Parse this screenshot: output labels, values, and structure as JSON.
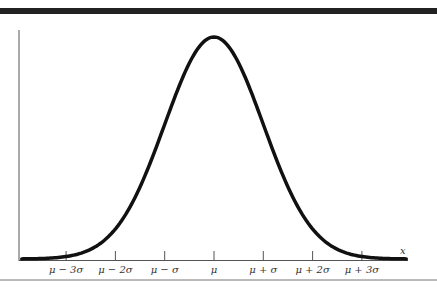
{
  "chart_data": {
    "type": "line",
    "title": "",
    "subtitle": "Normal distribution (bell curve)",
    "xlabel": "x",
    "ylabel": "",
    "tick_labels": [
      "μ − 3σ",
      "μ − 2σ",
      "μ − σ",
      "μ",
      "μ + σ",
      "μ + 2σ",
      "μ + 3σ"
    ],
    "tick_values": [
      -3,
      -2,
      -1,
      0,
      1,
      2,
      3
    ],
    "series": [
      {
        "name": "normal density",
        "function": "exp(-z^2/2)",
        "z_range": [
          -3.9,
          3.9
        ]
      }
    ],
    "xlim": [
      -3.9,
      3.9
    ],
    "ylim": [
      0,
      1
    ],
    "grid": false,
    "legend": null
  },
  "figure": {
    "x_axis_label": "x",
    "ticks": [
      {
        "label": "μ − 3σ",
        "z": -3
      },
      {
        "label": "μ − 2σ",
        "z": -2
      },
      {
        "label": "μ − σ",
        "z": -1
      },
      {
        "label": "μ",
        "z": 0
      },
      {
        "label": "μ + σ",
        "z": 1
      },
      {
        "label": "μ + 2σ",
        "z": 2
      },
      {
        "label": "μ + 3σ",
        "z": 3
      }
    ]
  }
}
